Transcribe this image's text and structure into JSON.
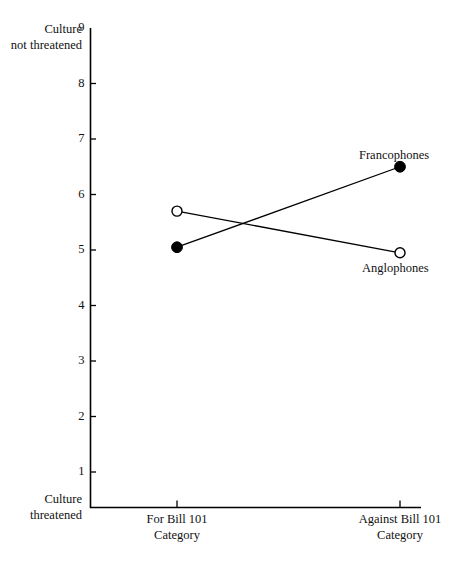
{
  "chart_data": {
    "type": "line",
    "title": "",
    "xlabel": "Category",
    "ylabel": "",
    "categories": [
      "For Bill 101",
      "Against Bill 101"
    ],
    "category_sublabels": [
      "Category",
      "Category"
    ],
    "ylim": [
      0,
      9
    ],
    "yticks": [
      1,
      2,
      3,
      4,
      5,
      6,
      7,
      8,
      9
    ],
    "ytick_labels": [
      "1",
      "2",
      "3",
      "4",
      "5",
      "6",
      "7",
      "8",
      "9"
    ],
    "y_axis_top_caption": "Culture not threatened",
    "y_axis_top_caption_line1": "Culture",
    "y_axis_top_caption_line2": "not threatened",
    "y_axis_bottom_caption": "Culture threatened",
    "y_axis_bottom_caption_line1": "Culture",
    "y_axis_bottom_caption_line2": "threatened",
    "grid": false,
    "legend_position": "inline-annotation",
    "series": [
      {
        "name": "Francophones",
        "marker": "filled-circle",
        "values": [
          5.05,
          6.5
        ]
      },
      {
        "name": "Anglophones",
        "marker": "open-circle",
        "values": [
          5.7,
          4.95
        ]
      }
    ],
    "colors": {
      "line": "#000000",
      "marker_fill": "#000000",
      "marker_open_fill": "#ffffff",
      "axis": "#000000",
      "background": "#ffffff"
    }
  },
  "annotations": {
    "francophones_label": "Francophones",
    "anglophones_label": "Anglophones"
  }
}
